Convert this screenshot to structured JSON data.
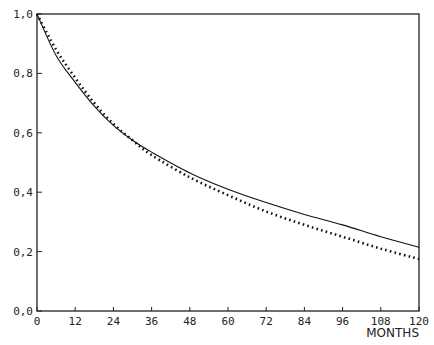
{
  "chart_data": {
    "type": "line",
    "title": "",
    "xlabel": "MONTHS",
    "ylabel": "",
    "xlim": [
      0,
      120
    ],
    "ylim": [
      0.0,
      1.0
    ],
    "grid": false,
    "legend": null,
    "x_ticks": [
      "0",
      "12",
      "24",
      "36",
      "48",
      "60",
      "72",
      "84",
      "96",
      "108",
      "120"
    ],
    "y_ticks": [
      "0,0",
      "0,2",
      "0,4",
      "0,6",
      "0,8",
      "1,0"
    ],
    "x": [
      0,
      6,
      12,
      18,
      24,
      30,
      36,
      48,
      60,
      72,
      84,
      96,
      108,
      120
    ],
    "series": [
      {
        "name": "solid",
        "style": "solid",
        "values": [
          1.0,
          0.86,
          0.77,
          0.69,
          0.625,
          0.575,
          0.535,
          0.465,
          0.41,
          0.365,
          0.325,
          0.29,
          0.25,
          0.215
        ]
      },
      {
        "name": "dotted",
        "style": "dotted",
        "values": [
          1.0,
          0.88,
          0.785,
          0.7,
          0.63,
          0.575,
          0.525,
          0.45,
          0.39,
          0.335,
          0.29,
          0.25,
          0.21,
          0.175
        ]
      }
    ]
  }
}
